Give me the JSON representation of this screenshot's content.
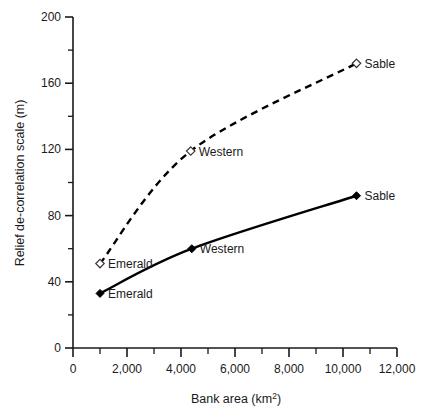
{
  "chart_data": {
    "type": "line",
    "title": "",
    "xlabel": "Bank area (km2)",
    "xlabel_main": "Bank area (km",
    "xlabel_sup": "2",
    "xlabel_tail": ")",
    "ylabel": "Relief de-correlation scale (m)",
    "xlim": [
      0,
      12000
    ],
    "ylim": [
      0,
      200
    ],
    "grid": false,
    "legend": "none (inline point labels)",
    "x_ticks_major": [
      "0",
      "2,000",
      "4,000",
      "6,000",
      "8,000",
      "10,000",
      "12,000"
    ],
    "x_ticks_major_values": [
      0,
      2000,
      4000,
      6000,
      8000,
      10000,
      12000
    ],
    "x_ticks_minor_values": [
      1000,
      3000,
      5000,
      7000,
      9000,
      11000
    ],
    "y_ticks_major": [
      "0",
      "40",
      "80",
      "120",
      "160",
      "200"
    ],
    "y_ticks_major_values": [
      0,
      40,
      80,
      120,
      160,
      200
    ],
    "y_ticks_minor_values": [
      20,
      60,
      100,
      140,
      180
    ],
    "series": [
      {
        "name": "upper-dashed",
        "marker": "open-diamond",
        "line": "dashed",
        "x": [
          1000,
          4360,
          10500
        ],
        "values": [
          51,
          119,
          172
        ],
        "point_labels": [
          "Emerald",
          "Western",
          "Sable"
        ]
      },
      {
        "name": "lower-solid",
        "marker": "filled-diamond",
        "line": "solid",
        "x": [
          1000,
          4400,
          10500
        ],
        "values": [
          33,
          60,
          92
        ],
        "point_labels": [
          "Emerald",
          "Western",
          "Sable"
        ]
      }
    ],
    "annotations": [
      {
        "text": "Sable",
        "x": 10500,
        "y": 172,
        "series": "upper-dashed"
      },
      {
        "text": "Western",
        "x": 4360,
        "y": 119,
        "series": "upper-dashed"
      },
      {
        "text": "Emerald",
        "x": 1000,
        "y": 51,
        "series": "upper-dashed"
      },
      {
        "text": "Sable",
        "x": 10500,
        "y": 92,
        "series": "lower-solid"
      },
      {
        "text": "Western",
        "x": 4400,
        "y": 60,
        "series": "lower-solid"
      },
      {
        "text": "Emerald",
        "x": 1000,
        "y": 33,
        "series": "lower-solid"
      }
    ],
    "colors": {
      "line": "#000000",
      "axis": "#1a1a1a",
      "background": "#ffffff",
      "open_marker_fill": "#ffffff"
    }
  }
}
